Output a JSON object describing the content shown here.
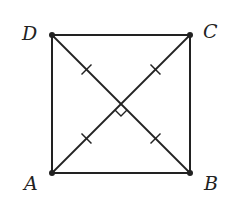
{
  "diagram": {
    "type": "geometry",
    "shape": "square",
    "vertices": [
      {
        "name": "A",
        "label": "A",
        "position": "bottom-left"
      },
      {
        "name": "B",
        "label": "B",
        "position": "bottom-right"
      },
      {
        "name": "C",
        "label": "C",
        "position": "top-right"
      },
      {
        "name": "D",
        "label": "D",
        "position": "top-left"
      }
    ],
    "sides": [
      "AB",
      "BC",
      "CD",
      "DA"
    ],
    "diagonals": [
      "AC",
      "BD"
    ],
    "annotations": {
      "congruent_tick_marks": "single tick on each half-diagonal (OA, OB, OC, OD equal)",
      "right_angle_marker": "at intersection of diagonals",
      "vertex_dots": true
    },
    "stroke_color": "#222222",
    "background_color": "#ffffff"
  }
}
